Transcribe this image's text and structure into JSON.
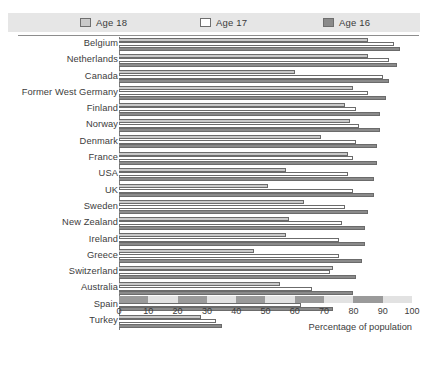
{
  "legend": {
    "items": [
      {
        "label": "Age 18",
        "key": "age18",
        "color": "#c9c9c9"
      },
      {
        "label": "Age 17",
        "key": "age17",
        "color": "#ffffff"
      },
      {
        "label": "Age 16",
        "key": "age16",
        "color": "#8a8a8a"
      }
    ]
  },
  "chart_data": {
    "type": "bar",
    "orientation": "horizontal",
    "title": "",
    "subtitle": "",
    "xlabel": "Percentage of population",
    "ylabel": "",
    "xlim": [
      0,
      100
    ],
    "xticks": [
      0,
      10,
      20,
      30,
      40,
      50,
      60,
      70,
      80,
      90,
      100
    ],
    "xtick_labels": [
      "0",
      "10",
      "20",
      "30",
      "40",
      "50",
      "60",
      "70",
      "80",
      "90",
      "100"
    ],
    "grid": false,
    "legend_position": "top",
    "categories": [
      "Belgium",
      "Netherlands",
      "Canada",
      "Former West Germany",
      "Finland",
      "Norway",
      "Denmark",
      "France",
      "USA",
      "UK",
      "Sweden",
      "New Zealand",
      "Ireland",
      "Greece",
      "Switzerland",
      "Australia",
      "Spain",
      "Turkey"
    ],
    "series": [
      {
        "name": "Age 18",
        "color": "#c9c9c9",
        "values": [
          85,
          85,
          60,
          80,
          77,
          79,
          69,
          78,
          57,
          51,
          63,
          58,
          57,
          46,
          73,
          55,
          53,
          28
        ]
      },
      {
        "name": "Age 17",
        "color": "#ffffff",
        "values": [
          94,
          92,
          90,
          85,
          81,
          82,
          81,
          80,
          78,
          80,
          77,
          76,
          75,
          75,
          72,
          66,
          62,
          33
        ]
      },
      {
        "name": "Age 16",
        "color": "#8a8a8a",
        "values": [
          96,
          95,
          92,
          91,
          89,
          89,
          88,
          88,
          87,
          87,
          85,
          84,
          84,
          83,
          81,
          80,
          73,
          35
        ]
      }
    ],
    "axis_band_segments": [
      {
        "from": 0,
        "to": 10,
        "shade": "dark"
      },
      {
        "from": 10,
        "to": 20,
        "shade": "light"
      },
      {
        "from": 20,
        "to": 30,
        "shade": "dark"
      },
      {
        "from": 30,
        "to": 40,
        "shade": "light"
      },
      {
        "from": 40,
        "to": 50,
        "shade": "dark"
      },
      {
        "from": 50,
        "to": 60,
        "shade": "light"
      },
      {
        "from": 60,
        "to": 70,
        "shade": "dark"
      },
      {
        "from": 70,
        "to": 80,
        "shade": "light"
      },
      {
        "from": 80,
        "to": 90,
        "shade": "dark"
      },
      {
        "from": 90,
        "to": 100,
        "shade": "light"
      }
    ]
  }
}
